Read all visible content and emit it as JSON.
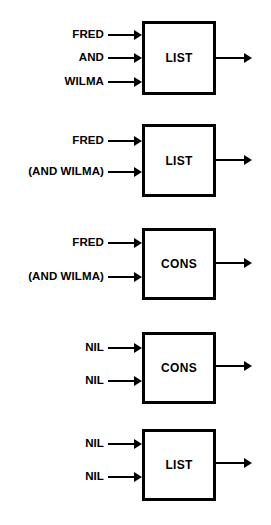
{
  "diagram": {
    "stroke_color": "#000000",
    "background_color": "#ffffff",
    "blocks": [
      {
        "id": "block-1",
        "operator": "LIST",
        "inputs": [
          "FRED",
          "AND",
          "WILMA"
        ],
        "output": ""
      },
      {
        "id": "block-2",
        "operator": "LIST",
        "inputs": [
          "FRED",
          "(AND WILMA)"
        ],
        "output": ""
      },
      {
        "id": "block-3",
        "operator": "CONS",
        "inputs": [
          "FRED",
          "(AND WILMA)"
        ],
        "output": ""
      },
      {
        "id": "block-4",
        "operator": "CONS",
        "inputs": [
          "NIL",
          "NIL"
        ],
        "output": ""
      },
      {
        "id": "block-5",
        "operator": "LIST",
        "inputs": [
          "NIL",
          "NIL"
        ],
        "output": ""
      }
    ]
  },
  "geometry": {
    "box_left": 142,
    "box_right": 216,
    "label_right_edge": 104,
    "input_line_start": 108,
    "output_line_end": 252,
    "blocks": [
      {
        "top": 21,
        "bottom": 95,
        "input_y": [
          35,
          58,
          82
        ],
        "output_y": 58
      },
      {
        "top": 124,
        "bottom": 197,
        "input_y": [
          141,
          172
        ],
        "output_y": 160
      },
      {
        "top": 228,
        "bottom": 300,
        "input_y": [
          243,
          277
        ],
        "output_y": 263
      },
      {
        "top": 332,
        "bottom": 404,
        "input_y": [
          348,
          381
        ],
        "output_y": 366
      },
      {
        "top": 429,
        "bottom": 501,
        "input_y": [
          444,
          477
        ],
        "output_y": 463
      }
    ]
  }
}
